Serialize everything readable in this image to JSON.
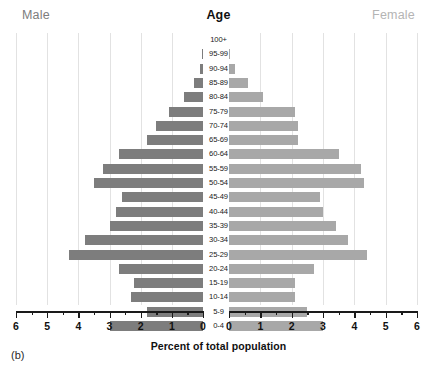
{
  "header": {
    "male_label": "Male",
    "female_label": "Female",
    "title": "Age"
  },
  "axis": {
    "xlabel": "Percent of total population",
    "tick_labels_left": [
      "6",
      "5",
      "4",
      "3",
      "2",
      "1",
      "0"
    ],
    "tick_labels_right": [
      "0",
      "1",
      "2",
      "3",
      "4",
      "5",
      "6"
    ]
  },
  "panel": {
    "letter": "(b)"
  },
  "colors": {
    "male_bar": "#7d7d7d",
    "female_bar": "#a8a8a8",
    "male_label": "#7d7d7d",
    "female_label": "#b4b4b4",
    "gridline": "#e2e2e2",
    "axis": "#1a1a1a",
    "background": "#ffffff"
  },
  "chart_data": {
    "type": "bar",
    "subtype": "population-pyramid",
    "title": "Age",
    "xlabel": "Percent of total population",
    "ylabel": "Age",
    "xlim": [
      0,
      6
    ],
    "grid": true,
    "orientation": "horizontal",
    "legend": [
      "Male",
      "Female"
    ],
    "categories": [
      "100+",
      "95-99",
      "90-94",
      "85-89",
      "80-84",
      "75-79",
      "70-74",
      "65-69",
      "60-64",
      "55-59",
      "50-54",
      "45-49",
      "40-44",
      "35-39",
      "30-34",
      "25-29",
      "20-24",
      "15-19",
      "10-14",
      "5-9",
      "0-4"
    ],
    "series": [
      {
        "name": "Male",
        "side": "left",
        "values": [
          0.0,
          0.03,
          0.1,
          0.3,
          0.6,
          1.1,
          1.5,
          1.8,
          2.7,
          3.2,
          3.5,
          2.6,
          2.8,
          3.0,
          3.8,
          4.3,
          2.7,
          2.2,
          2.3,
          1.8,
          3.0
        ]
      },
      {
        "name": "Female",
        "side": "right",
        "values": [
          0.0,
          0.03,
          0.2,
          0.6,
          1.1,
          2.1,
          2.2,
          2.2,
          3.5,
          4.2,
          4.3,
          2.9,
          3.0,
          3.4,
          3.8,
          4.4,
          2.7,
          2.1,
          2.1,
          2.5,
          3.0
        ]
      }
    ]
  }
}
